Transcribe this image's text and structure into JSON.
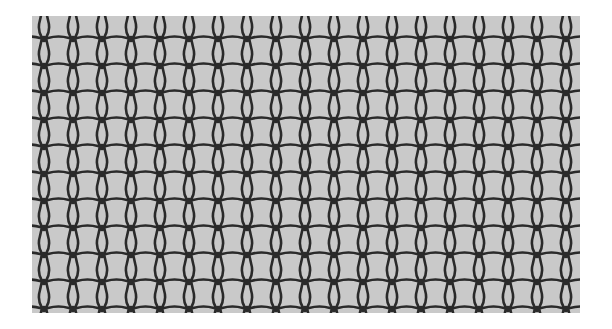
{
  "image": {
    "subject": "knitted-mesh-fabric",
    "description": "Grayscale photograph of a knitted net fabric with interlocking loops",
    "colors": {
      "background": "#ffffff",
      "fabric_fill": "#c9c9c9",
      "yarn": "#2a2a2a"
    },
    "grid": {
      "columns": 19,
      "rows": 11,
      "col_spacing": 29,
      "row_spacing": 27
    }
  }
}
